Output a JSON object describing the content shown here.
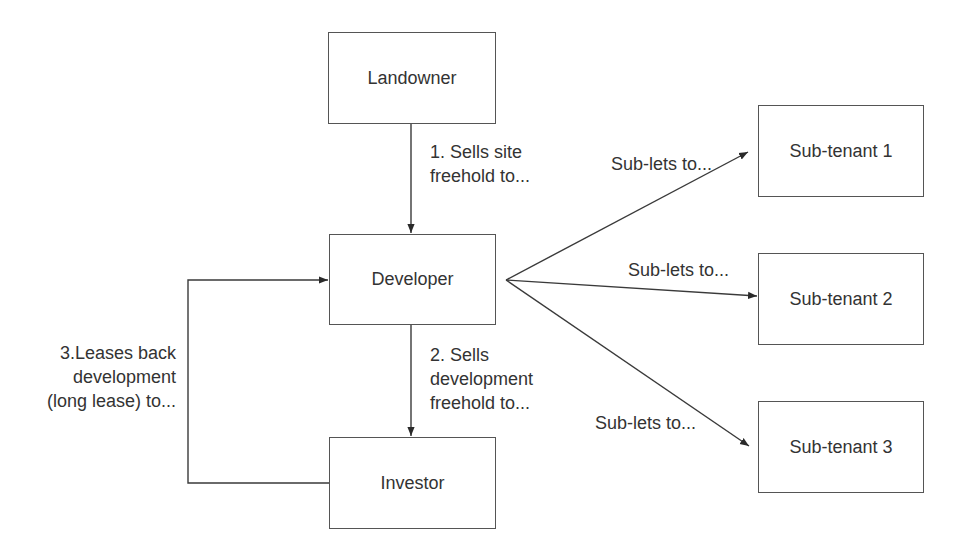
{
  "nodes": {
    "landowner": "Landowner",
    "developer": "Developer",
    "investor": "Investor",
    "subtenant1": "Sub-tenant 1",
    "subtenant2": "Sub-tenant 2",
    "subtenant3": "Sub-tenant 3"
  },
  "edges": {
    "step1": [
      "1. Sells site",
      "freehold to..."
    ],
    "step2": [
      "2. Sells",
      "development",
      "freehold to..."
    ],
    "step3": [
      "3.Leases back",
      "development",
      "(long lease) to..."
    ],
    "sublet1": "Sub-lets to...",
    "sublet2": "Sub-lets to...",
    "sublet3": "Sub-lets to..."
  },
  "colors": {
    "line": "#3a3a3a",
    "text": "#333333",
    "background": "#ffffff"
  }
}
